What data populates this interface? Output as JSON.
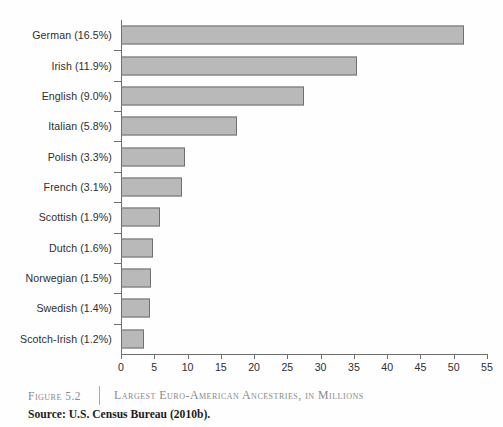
{
  "chart_data": {
    "type": "bar",
    "orientation": "horizontal",
    "title": "Largest Euro-American Ancestries, in Millions",
    "xlabel": "",
    "ylabel": "",
    "xlim": [
      0,
      55
    ],
    "xticks": [
      0,
      5,
      10,
      15,
      20,
      25,
      30,
      35,
      40,
      45,
      50,
      55
    ],
    "grid": false,
    "legend": null,
    "categories": [
      "German (16.5%)",
      "Irish (11.9%)",
      "English (9.0%)",
      "Italian (5.8%)",
      "Polish (3.3%)",
      "French (3.1%)",
      "Scottish (1.9%)",
      "Dutch (1.6%)",
      "Norwegian (1.5%)",
      "Swedish (1.4%)",
      "Scotch-Irish (1.2%)"
    ],
    "values": [
      51.5,
      35.5,
      27.5,
      17.5,
      9.6,
      9.2,
      5.8,
      4.8,
      4.5,
      4.3,
      3.5
    ],
    "units": "millions",
    "bar_fill_color": "#b9b9b9",
    "bar_border_color": "#6f6f6f",
    "axis_color": "#6e6e6e",
    "rows": [
      {
        "label": "German (16.5%)",
        "percent": "16.5%",
        "value": 51.5
      },
      {
        "label": "Irish (11.9%)",
        "percent": "11.9%",
        "value": 35.5
      },
      {
        "label": "English (9.0%)",
        "percent": "9.0%",
        "value": 27.5
      },
      {
        "label": "Italian (5.8%)",
        "percent": "5.8%",
        "value": 17.5
      },
      {
        "label": "Polish (3.3%)",
        "percent": "3.3%",
        "value": 9.6
      },
      {
        "label": "French (3.1%)",
        "percent": "3.1%",
        "value": 9.2
      },
      {
        "label": "Scottish (1.9%)",
        "percent": "1.9%",
        "value": 5.8
      },
      {
        "label": "Dutch (1.6%)",
        "percent": "1.6%",
        "value": 4.8
      },
      {
        "label": "Norwegian (1.5%)",
        "percent": "1.5%",
        "value": 4.5
      },
      {
        "label": "Swedish (1.4%)",
        "percent": "1.4%",
        "value": 4.3
      },
      {
        "label": "Scotch-Irish (1.2%)",
        "percent": "1.2%",
        "value": 3.5
      }
    ]
  },
  "caption": {
    "figure_number": "Figure 5.2",
    "title": "Largest Euro-American Ancestries, in Millions",
    "source": "Source: U.S. Census Bureau (2010b)."
  }
}
